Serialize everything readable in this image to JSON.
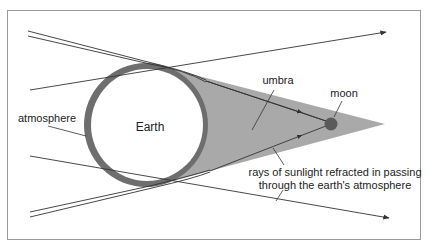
{
  "diagram": {
    "type": "lunar-eclipse-umbra",
    "labels": {
      "earth": "Earth",
      "atmosphere": "atmosphere",
      "umbra": "umbra",
      "moon": "moon",
      "refraction_line1": "rays of sunlight refracted in passing",
      "refraction_line2": "through the earth's atmosphere"
    },
    "colors": {
      "background": "#ffffff",
      "frame": "#9a9a9a",
      "umbra_fill": "#a9a9a9",
      "atmosphere_ring": "#6e6e6e",
      "earth_fill": "#ffffff",
      "moon_fill": "#5a5a5a",
      "ray_line": "#333333"
    }
  }
}
